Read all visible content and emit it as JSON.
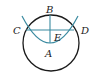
{
  "diagram": {
    "labels": {
      "A": "A",
      "B": "B",
      "C": "C",
      "D": "D",
      "E": "E"
    },
    "colors": {
      "circle": "#1a1a1a",
      "arc": "#3a8aa0",
      "lines": "#3a8aa0",
      "text": "#222222"
    }
  }
}
